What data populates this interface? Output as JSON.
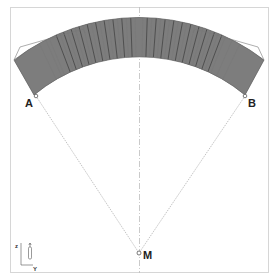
{
  "diagram": {
    "type": "structural cross-section (arch of stacked rows)",
    "points": {
      "A": {
        "label": "A"
      },
      "B": {
        "label": "B"
      },
      "M": {
        "label": "M"
      }
    },
    "axes": {
      "z_label": "z",
      "y_label": "Y"
    },
    "colors": {
      "frame": "#d8d8d8",
      "arch_fill": "#8c8c8c",
      "arch_dark": "#555555",
      "construction_line": "#b0b0b0",
      "labels": "#222222"
    }
  }
}
